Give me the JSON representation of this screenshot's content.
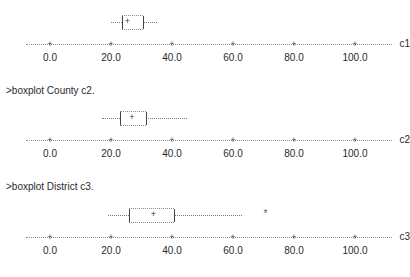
{
  "session": {
    "commands": [
      {
        "text": ">boxplot County c2."
      },
      {
        "text": ">boxplot District c3."
      }
    ]
  },
  "axis": {
    "tick_labels": [
      "0.0",
      "20.0",
      "40.0",
      "60.0",
      "80.0",
      "100.0"
    ],
    "tick_values": [
      0,
      20,
      40,
      60,
      80,
      100
    ],
    "tick_glyph": "+",
    "min": -8,
    "max": 112
  },
  "chart_data": {
    "type": "box",
    "title": "",
    "xlabel": "",
    "ylabel": "",
    "grid": false,
    "legend": "none",
    "orientation": "horizontal",
    "xlim": [
      -8,
      112
    ],
    "xticks": [
      0,
      20,
      40,
      60,
      80,
      100
    ],
    "xticklabels": [
      "0.0",
      "20.0",
      "40.0",
      "60.0",
      "80.0",
      "100.0"
    ],
    "plots": [
      {
        "name": "c1",
        "axis_label": "c1",
        "whisker_low": 20.0,
        "q1": 23.5,
        "median": 25.5,
        "q3": 30.5,
        "whisker_high": 35.0,
        "outliers": []
      },
      {
        "name": "c2",
        "axis_label": "c2",
        "whisker_low": 17.0,
        "q1": 23.0,
        "median": 27.0,
        "q3": 31.5,
        "whisker_high": 45.0,
        "outliers": []
      },
      {
        "name": "c3",
        "axis_label": "c3",
        "whisker_low": 19.0,
        "q1": 26.0,
        "median": 34.0,
        "q3": 40.5,
        "whisker_high": 63.0,
        "outliers": [
          71.0
        ]
      }
    ]
  },
  "layout": {
    "plot_tops": [
      0,
      96,
      193
    ],
    "axis_y_in_plot": 44,
    "box_center_y_in_plot": 22
  }
}
